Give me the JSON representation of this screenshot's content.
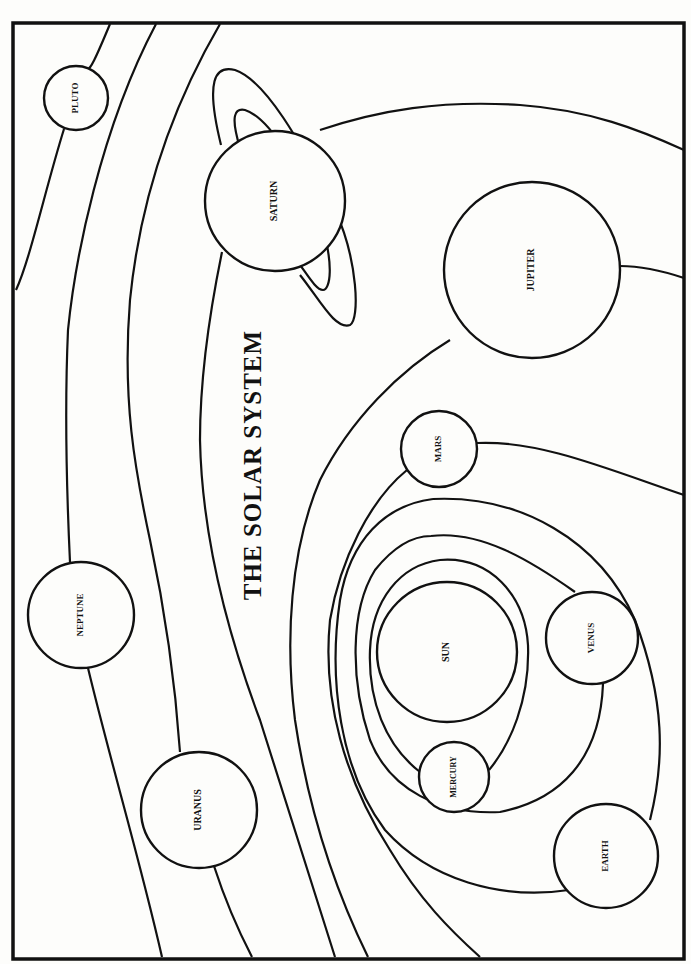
{
  "title": "THE SOLAR SYSTEM",
  "colors": {
    "ink": "#111111",
    "paper": "#fdfdfb"
  },
  "frame": {
    "x": 13,
    "y": 23,
    "w": 671,
    "h": 936
  },
  "title_pos": {
    "x": 255,
    "y": 465,
    "size": 25
  },
  "planets": [
    {
      "id": "sun",
      "label": "SUN",
      "cx": 447,
      "cy": 652,
      "r": 70,
      "size": 10
    },
    {
      "id": "mercury",
      "label": "MERCURY",
      "cx": 454,
      "cy": 777,
      "r": 35,
      "size": 8
    },
    {
      "id": "venus",
      "label": "VENUS",
      "cx": 592,
      "cy": 638,
      "r": 46,
      "size": 9
    },
    {
      "id": "earth",
      "label": "EARTH",
      "cx": 606,
      "cy": 856,
      "r": 52,
      "size": 9
    },
    {
      "id": "mars",
      "label": "MARS",
      "cx": 439,
      "cy": 449,
      "r": 38,
      "size": 9
    },
    {
      "id": "jupiter",
      "label": "JUPITER",
      "cx": 532,
      "cy": 270,
      "r": 88,
      "size": 10
    },
    {
      "id": "saturn",
      "label": "SATURN",
      "cx": 275,
      "cy": 201,
      "r": 70,
      "size": 10
    },
    {
      "id": "uranus",
      "label": "URANUS",
      "cx": 199,
      "cy": 810,
      "r": 58,
      "size": 10
    },
    {
      "id": "neptune",
      "label": "NEPTUNE",
      "cx": 81,
      "cy": 615,
      "r": 53,
      "size": 9
    },
    {
      "id": "pluto",
      "label": "PLUTO",
      "cx": 76,
      "cy": 98,
      "r": 32,
      "size": 9
    }
  ]
}
